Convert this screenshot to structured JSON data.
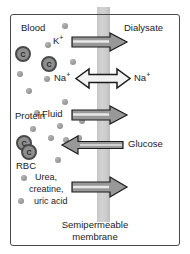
{
  "diagram": {
    "compartments": {
      "left_label": "Blood",
      "right_label": "Dialysate"
    },
    "caption_line1": "Semipermeable",
    "caption_line2": "membrane",
    "blood_contents": [
      {
        "label": "Protein"
      },
      {
        "label": "RBC"
      }
    ],
    "cell_glyph": "C",
    "transfers": [
      {
        "name": "potassium",
        "label": "K",
        "charge": "+",
        "direction": "right",
        "style": "block"
      },
      {
        "name": "sodium-left",
        "label": "Na",
        "charge": "+",
        "direction": "bidirectional",
        "style": "hollow"
      },
      {
        "name": "sodium-right",
        "label": "Na",
        "charge": "+",
        "direction": "bidirectional",
        "style": "hollow"
      },
      {
        "name": "fluid",
        "label": "Fluid",
        "charge": "",
        "direction": "right",
        "style": "block"
      },
      {
        "name": "glucose",
        "label": "Glucose",
        "charge": "",
        "direction": "left",
        "style": "thin"
      },
      {
        "name": "wastes",
        "label": "Urea, creatine, uric acid",
        "charge": "",
        "direction": "right",
        "style": "block"
      }
    ],
    "waste_lines": [
      "Urea,",
      "creatine,",
      "uric acid"
    ],
    "colors": {
      "membrane": "#c9c9c9",
      "frame": "#4a4a4a",
      "dot": "#9a9a9a",
      "cell_fill": "#8f8f8f",
      "cell_stroke": "#4a4a4a",
      "arrow_fill": "#8c8c8c",
      "arrow_stroke": "#1b1b1b",
      "background": "#ffffff",
      "text": "#1b1b1b"
    }
  }
}
